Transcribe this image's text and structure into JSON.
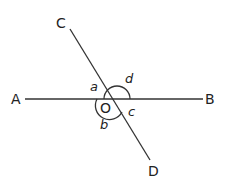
{
  "diagram": {
    "type": "intersecting-lines",
    "center_point": "O",
    "points": {
      "A": "A",
      "B": "B",
      "C": "C",
      "D": "D",
      "O": "O"
    },
    "angles": {
      "a": "a",
      "b": "b",
      "c": "c",
      "d": "d"
    },
    "lines": [
      "AB",
      "CD"
    ],
    "line_color": "#333333"
  }
}
